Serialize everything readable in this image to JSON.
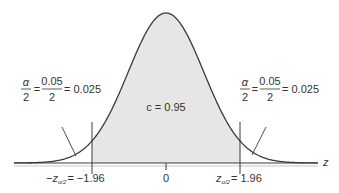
{
  "chart_data": {
    "type": "area",
    "title": "",
    "xlabel": "z",
    "ylabel": "",
    "center_label": "c = 0.95",
    "confidence_level": 0.95,
    "alpha": 0.05,
    "tail_area": 0.025,
    "critical_values": [
      -1.96,
      1.96
    ],
    "tick_labels": [
      "−z",
      "0",
      "z",
      "−1.96",
      "1.96"
    ],
    "x_ticks": [
      -1.96,
      0,
      1.96
    ],
    "shaded_region": [
      -1.96,
      1.96
    ]
  },
  "labels": {
    "left_tail": {
      "alpha": "α",
      "two": "2",
      "eq1": "=",
      "num": "0.05",
      "den": "2",
      "eq2": "= 0.025"
    },
    "right_tail": {
      "alpha": "α",
      "two": "2",
      "eq1": "=",
      "num": "0.05",
      "den": "2",
      "eq2": "= 0.025"
    },
    "center": "c = 0.95",
    "axis_var": "z",
    "left_crit": {
      "prefix": "−z",
      "sub": "α/2",
      "value": "= −1.96"
    },
    "zero": "0",
    "right_crit": {
      "prefix": "z",
      "sub": "α/2",
      "value": "= 1.96"
    }
  },
  "colors": {
    "curve": "#3a3a3a",
    "shade": "#e6e6e6",
    "axis": "#3a3a3a",
    "text": "#333333"
  }
}
